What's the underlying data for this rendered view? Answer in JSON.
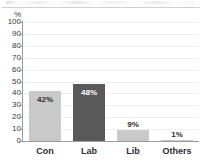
{
  "chart_data": {
    "type": "bar",
    "title": "",
    "xlabel": "",
    "ylabel": "%",
    "categories": [
      "Con",
      "Lab",
      "Lib",
      "Others"
    ],
    "values": [
      42,
      48,
      9,
      1
    ],
    "data_labels": [
      "42%",
      "48%",
      "9%",
      "1%"
    ],
    "ylim": [
      0,
      100
    ],
    "ytick_labels": [
      "100",
      "90",
      "80",
      "70",
      "60",
      "50",
      "40",
      "30",
      "20",
      "10",
      "0"
    ],
    "ytick_values": [
      100,
      90,
      80,
      70,
      60,
      50,
      40,
      30,
      20,
      10,
      0
    ],
    "grid": true,
    "legend": "none",
    "series": [
      {
        "name": "Vote share",
        "values": [
          42,
          48,
          9,
          1
        ]
      }
    ],
    "bar_colors": [
      "#c9c9c9",
      "#595959",
      "#c9c9c9",
      "#c9c9c9"
    ],
    "bar_label_colors": [
      "#2b2b2b",
      "#ffffff",
      "#2b2b2b",
      "#2b2b2b"
    ],
    "axis_color": "#9b9b9b",
    "grid_color": "#f0f0f0",
    "background_color": "#ffffff"
  }
}
